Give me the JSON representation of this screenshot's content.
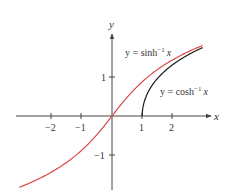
{
  "chart_data": {
    "type": "line",
    "title": "",
    "xlabel": "x",
    "ylabel": "y",
    "xlim": [
      -3.07,
      3.0
    ],
    "ylim": [
      -1.85,
      2.1
    ],
    "grid": false,
    "legend": null,
    "x_ticks": [
      {
        "value": -2,
        "label": "−2"
      },
      {
        "value": -1,
        "label": "−1"
      },
      {
        "value": 1,
        "label": "1"
      },
      {
        "value": 2,
        "label": "2"
      }
    ],
    "y_ticks": [
      {
        "value": 1,
        "label": "1"
      },
      {
        "value": -1,
        "label": "−1"
      }
    ],
    "series": [
      {
        "name": "y = sinh⁻¹ x",
        "function": "asinh",
        "color": "#d9464b",
        "domain": [
          -3.07,
          3.0
        ],
        "x": [
          -3,
          -2,
          -1,
          0,
          1,
          2,
          3
        ],
        "y": [
          -1.818,
          -1.444,
          -0.881,
          0,
          0.881,
          1.444,
          1.818
        ]
      },
      {
        "name": "y = cosh⁻¹ x",
        "function": "acosh",
        "color": "#1a1a1a",
        "domain": [
          1,
          3.0
        ],
        "x": [
          1,
          1.5,
          2,
          2.5,
          3
        ],
        "y": [
          0,
          0.962,
          1.317,
          1.567,
          1.763
        ]
      }
    ],
    "annotations": [
      {
        "text_prefix": "y = sinh",
        "sup": "−1",
        "var": "x",
        "series": "sinh"
      },
      {
        "text_prefix": "y = cosh",
        "sup": "−1",
        "var": "x",
        "series": "cosh"
      }
    ]
  },
  "labels": {
    "x_axis": "x",
    "y_axis": "y",
    "sinh_prefix": "y = sinh",
    "sinh_sup": "−1",
    "sinh_var": "x",
    "cosh_prefix": "y = cosh",
    "cosh_sup": "−1",
    "cosh_var": "x",
    "xt_m2": "−2",
    "xt_m1": "−1",
    "xt_1": "1",
    "xt_2": "2",
    "yt_1": "1",
    "yt_m1": "−1"
  },
  "colors": {
    "sinh": "#d9464b",
    "cosh": "#1a1a1a",
    "axis": "#444444"
  }
}
